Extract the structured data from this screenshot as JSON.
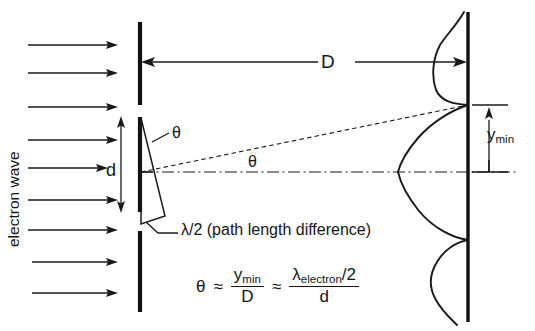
{
  "figure": {
    "labels": {
      "source_label": "electron wave",
      "distance_label": "D",
      "slit_width_label": "d",
      "theta_at_slit": "θ",
      "theta_at_axis": "θ",
      "ymin_label": "y",
      "ymin_subscript": "min",
      "path_difference_note": "λ/2 (path length difference)"
    },
    "formula": {
      "theta_symbol": "θ",
      "approx_1": "≈",
      "frac1_numerator": "y",
      "frac1_numerator_sub": "min",
      "frac1_denominator": "D",
      "approx_2": "≈",
      "frac2_numerator": "λ",
      "frac2_numerator_sub": "electron",
      "frac2_numerator_tail": "/2",
      "frac2_denominator": "d"
    },
    "colors": {
      "ink": "#1a1a1a",
      "background": "#ffffff"
    },
    "geometry": {
      "barrier_x": 140,
      "screen_x": 468,
      "axis_y": 172,
      "incoming_arrow_count": 9,
      "incoming_arrow_y": [
        45,
        73,
        107,
        140,
        168,
        200,
        230,
        262,
        293
      ],
      "incoming_arrow_x_start": 28,
      "incoming_arrow_x_end": 118,
      "slit_top_y": 117,
      "slit_bottom_y": 212,
      "first_minimum_y": 105,
      "mirrored_minimum_y": 240,
      "central_peak_x": 398,
      "side_lobe_upper_peak": {
        "x": 440,
        "y": 45
      },
      "side_lobe_lower_peak": {
        "x": 437,
        "y": 290
      }
    }
  }
}
